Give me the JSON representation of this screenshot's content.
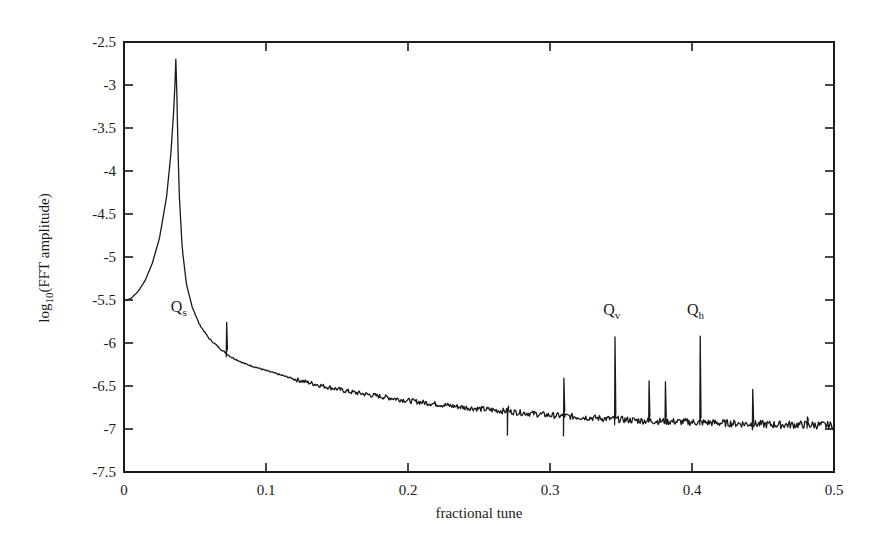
{
  "chart_data": {
    "type": "line",
    "title": "",
    "xlabel": "fractional tune",
    "ylabel_main": "log",
    "ylabel_sub": "10",
    "ylabel_rest": "(FFT amplitude)",
    "ylabel": "log10(FFT amplitude)",
    "xlim": [
      0,
      0.5
    ],
    "ylim": [
      -7.5,
      -2.5
    ],
    "grid": false,
    "legend": "none",
    "x_ticks": [
      0,
      0.1,
      0.2,
      0.3,
      0.4,
      0.5
    ],
    "x_tick_labels": [
      "0",
      "0.1",
      "0.2",
      "0.3",
      "0.4",
      "0.5"
    ],
    "y_ticks": [
      -2.5,
      -3,
      -3.5,
      -4,
      -4.5,
      -5,
      -5.5,
      -6,
      -6.5,
      -7,
      -7.5
    ],
    "y_tick_labels": [
      "-2.5",
      "-3",
      "-3.5",
      "-4",
      "-4.5",
      "-5",
      "-5.5",
      "-6",
      "-6.5",
      "-7",
      "-7.5"
    ],
    "series": [
      {
        "name": "FFT spectrum",
        "color": "#1a1a1a",
        "baseline": {
          "x": [
            0,
            0.005,
            0.01,
            0.015,
            0.02,
            0.025,
            0.03,
            0.033,
            0.035,
            0.036,
            0.0365,
            0.037,
            0.0375,
            0.038,
            0.039,
            0.041,
            0.044,
            0.048,
            0.053,
            0.06,
            0.068,
            0.075,
            0.085,
            0.1,
            0.12,
            0.14,
            0.16,
            0.18,
            0.2,
            0.22,
            0.24,
            0.26,
            0.28,
            0.3,
            0.32,
            0.34,
            0.36,
            0.38,
            0.4,
            0.42,
            0.44,
            0.46,
            0.48,
            0.5
          ],
          "y": [
            -5.51,
            -5.48,
            -5.4,
            -5.27,
            -5.07,
            -4.78,
            -4.3,
            -3.8,
            -3.3,
            -2.95,
            -2.7,
            -2.95,
            -3.3,
            -3.75,
            -4.3,
            -4.9,
            -5.32,
            -5.58,
            -5.78,
            -5.95,
            -6.07,
            -6.16,
            -6.24,
            -6.32,
            -6.42,
            -6.5,
            -6.57,
            -6.62,
            -6.67,
            -6.71,
            -6.75,
            -6.78,
            -6.81,
            -6.84,
            -6.86,
            -6.88,
            -6.9,
            -6.91,
            -6.92,
            -6.93,
            -6.94,
            -6.95,
            -6.95,
            -6.96
          ]
        },
        "spikes": [
          {
            "x": 0.072,
            "top": -5.76,
            "bottom": -6.16
          },
          {
            "x": 0.27,
            "top": -6.76,
            "bottom": -7.07
          },
          {
            "x": 0.3095,
            "top": -6.41,
            "bottom": -7.08
          },
          {
            "x": 0.3455,
            "top": -5.93,
            "bottom": -6.95
          },
          {
            "x": 0.3695,
            "top": -6.44,
            "bottom": -6.92
          },
          {
            "x": 0.381,
            "top": -6.45,
            "bottom": -6.93
          },
          {
            "x": 0.4055,
            "top": -5.92,
            "bottom": -6.95
          },
          {
            "x": 0.4425,
            "top": -6.54,
            "bottom": -7.01
          },
          {
            "x": 0.481,
            "top": -6.86,
            "bottom": -6.99
          }
        ]
      }
    ],
    "annotations": [
      {
        "text": "Q",
        "sub": "s",
        "x": 0.033,
        "y": -5.64
      },
      {
        "text": "Q",
        "sub": "v",
        "x": 0.3375,
        "y": -5.68
      },
      {
        "text": "Q",
        "sub": "h",
        "x": 0.3965,
        "y": -5.68
      }
    ]
  }
}
